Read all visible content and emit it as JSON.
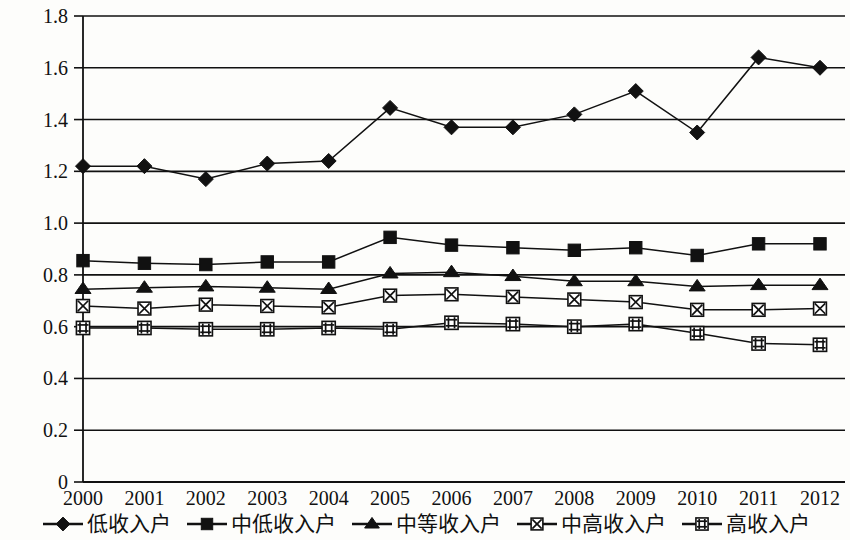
{
  "chart_data": {
    "type": "line",
    "title": "",
    "subtitle": "",
    "xlabel": "",
    "ylabel": "",
    "categories": [
      "2000",
      "2001",
      "2002",
      "2003",
      "2004",
      "2005",
      "2006",
      "2007",
      "2008",
      "2009",
      "2010",
      "2011",
      "2012"
    ],
    "ylim": [
      0,
      1.8
    ],
    "ytick_labels": [
      "0",
      "0.2",
      "0.4",
      "0.6",
      "0.8",
      "1.0",
      "1.2",
      "1.4",
      "1.6",
      "1.8"
    ],
    "ytick_values": [
      0,
      0.2,
      0.4,
      0.6,
      0.8,
      1.0,
      1.2,
      1.4,
      1.6,
      1.8
    ],
    "grid": true,
    "legend_position": "bottom",
    "series": [
      {
        "name": "低收入户",
        "marker": "diamond",
        "color": "#111111",
        "values": [
          1.22,
          1.22,
          1.17,
          1.23,
          1.24,
          1.445,
          1.37,
          1.37,
          1.42,
          1.51,
          1.35,
          1.64,
          1.6
        ]
      },
      {
        "name": "中低收入户",
        "marker": "square",
        "color": "#111111",
        "values": [
          0.855,
          0.845,
          0.84,
          0.85,
          0.85,
          0.945,
          0.915,
          0.905,
          0.895,
          0.905,
          0.875,
          0.92,
          0.92
        ]
      },
      {
        "name": "中等收入户",
        "marker": "triangle",
        "color": "#111111",
        "values": [
          0.745,
          0.75,
          0.755,
          0.75,
          0.745,
          0.805,
          0.81,
          0.795,
          0.775,
          0.775,
          0.755,
          0.76,
          0.76
        ]
      },
      {
        "name": "中高收入户",
        "marker": "x-box",
        "color": "#111111",
        "values": [
          0.68,
          0.67,
          0.685,
          0.68,
          0.675,
          0.72,
          0.725,
          0.715,
          0.705,
          0.695,
          0.665,
          0.665,
          0.67
        ]
      },
      {
        "name": "高收入户",
        "marker": "hash-box",
        "color": "#111111",
        "values": [
          0.595,
          0.595,
          0.59,
          0.59,
          0.595,
          0.59,
          0.615,
          0.61,
          0.6,
          0.61,
          0.575,
          0.535,
          0.53
        ]
      }
    ]
  },
  "legend": {
    "items": [
      {
        "label": "低收入户",
        "marker": "diamond"
      },
      {
        "label": "中低收入户",
        "marker": "square"
      },
      {
        "label": "中等收入户",
        "marker": "triangle"
      },
      {
        "label": "中高收入户",
        "marker": "x-box"
      },
      {
        "label": "高收入户",
        "marker": "hash-box"
      }
    ]
  }
}
